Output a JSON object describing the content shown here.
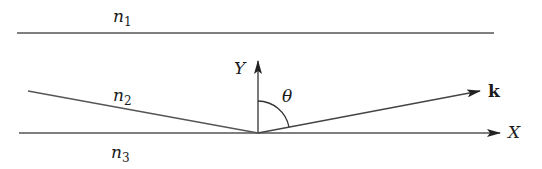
{
  "diagram": {
    "type": "waveguide-ray",
    "layers": [
      {
        "name": "n",
        "sub": "1"
      },
      {
        "name": "n",
        "sub": "2"
      },
      {
        "name": "n",
        "sub": "3"
      }
    ],
    "axes": {
      "y_label": "Y",
      "x_label": "X"
    },
    "angle_label": "θ",
    "vector_label": "k",
    "colors": {
      "line": "#333333",
      "background": "#ffffff"
    }
  }
}
